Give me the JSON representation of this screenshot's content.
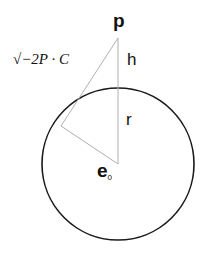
{
  "labels": {
    "point_p": "p",
    "height": "h",
    "radius": "r",
    "center": "e",
    "center_sub": "0",
    "tangent_length": "√−2P · C"
  },
  "geometry": {
    "point_p": [
      118,
      38
    ],
    "center": [
      118,
      164
    ],
    "radius": 76,
    "tangent_point": [
      61,
      126
    ]
  },
  "colors": {
    "circle": "#1a1a1a",
    "construction_lines": "#b0b0b0",
    "text": "#111111"
  }
}
